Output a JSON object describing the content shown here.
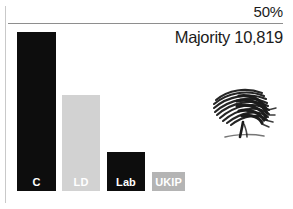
{
  "chart_data": {
    "type": "bar",
    "title": "",
    "categories": [
      "C",
      "LD",
      "Lab",
      "UKIP"
    ],
    "series": [
      {
        "name": "Share of vote",
        "values": [
          50.0,
          30.2,
          12.2,
          5.8
        ]
      }
    ],
    "values": [
      50.0,
      30.2,
      12.2,
      5.8
    ],
    "xlabel": "",
    "ylabel": "",
    "ylim": [
      0,
      50
    ],
    "grid": false,
    "legend": "none",
    "annotations": [
      {
        "name": "threshold",
        "text": "50%",
        "value": 50
      },
      {
        "name": "majority",
        "text": "Majority 10,819",
        "value": 10819
      }
    ],
    "bar_colors": [
      "#0d0d0d",
      "#d2d2d2",
      "#0d0d0d",
      "#b4b4b4"
    ]
  },
  "chart": {
    "threshold_label": "50%",
    "majority_label": "Majority 10,819",
    "bars": [
      {
        "label": "C",
        "color": "#0d0d0d",
        "label_color": "#ffffff",
        "x": 17,
        "width": 39,
        "top": 32,
        "height": 159
      },
      {
        "label": "LD",
        "color": "#d2d2d2",
        "label_color": "#ffffff",
        "x": 62,
        "width": 38,
        "top": 95,
        "height": 96
      },
      {
        "label": "Lab",
        "color": "#0d0d0d",
        "label_color": "#ffffff",
        "x": 107,
        "width": 38,
        "top": 152,
        "height": 39
      },
      {
        "label": "UKIP",
        "color": "#b4b4b4",
        "label_color": "#ffffff",
        "x": 152,
        "width": 33,
        "top": 172,
        "height": 19
      }
    ],
    "logo": {
      "name": "conservative-oak-tree-logo",
      "color": "#1a1a1a"
    }
  }
}
